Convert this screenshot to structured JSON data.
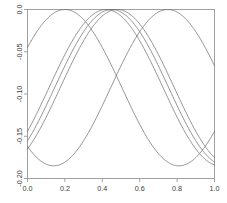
{
  "chart_data": {
    "type": "line",
    "title": "",
    "subtitle": "",
    "xlabel": "",
    "ylabel": "",
    "xlim": [
      0.0,
      1.0
    ],
    "ylim": [
      -0.2,
      0.0
    ],
    "grid": false,
    "legend": null,
    "x_ticks": [
      {
        "value": 0.0,
        "label": "0.0"
      },
      {
        "value": 0.2,
        "label": "0.2"
      },
      {
        "value": 0.4,
        "label": "0.4"
      },
      {
        "value": 0.6,
        "label": "0.6"
      },
      {
        "value": 0.8,
        "label": "0.8"
      },
      {
        "value": 1.0,
        "label": "1.0"
      }
    ],
    "y_ticks": [
      {
        "value": 0.0,
        "label": "0.0"
      },
      {
        "value": -0.05,
        "label": "-0.05"
      },
      {
        "value": -0.1,
        "label": "-0.10"
      },
      {
        "value": -0.15,
        "label": "-0.15"
      },
      {
        "value": -0.2,
        "label": "-0.20"
      }
    ],
    "line_color": "#6e6e6e",
    "frame_color": "#8a8a8a",
    "series": [
      {
        "name": "curve-1",
        "form": "cosine",
        "amplitude": 0.0925,
        "offset": -0.0925,
        "period": 1.22,
        "peak_x": 0.2,
        "peak_y": 0.0,
        "trough_y": -0.185,
        "x": [
          0.0,
          0.05,
          0.1,
          0.15,
          0.2,
          0.25,
          0.3,
          0.35,
          0.4,
          0.45,
          0.5,
          0.55,
          0.6,
          0.65,
          0.7,
          0.75,
          0.8,
          0.85,
          0.9,
          0.95,
          1.0
        ],
        "y": [
          -0.0615,
          -0.0359,
          -0.016,
          -0.004,
          0.0,
          -0.004,
          -0.016,
          -0.0359,
          -0.0615,
          -0.091,
          -0.1217,
          -0.1505,
          -0.173,
          -0.1842,
          -0.1843,
          -0.1734,
          -0.151,
          -0.1223,
          -0.0917,
          -0.062,
          -0.0363
        ]
      },
      {
        "name": "curve-2",
        "form": "cosine",
        "amplitude": 0.0925,
        "offset": -0.0925,
        "period": 1.22,
        "peak_x": 0.42,
        "peak_y": 0.0,
        "trough_y": -0.185,
        "x": [
          0.0,
          0.05,
          0.1,
          0.15,
          0.2,
          0.25,
          0.3,
          0.35,
          0.4,
          0.45,
          0.5,
          0.55,
          0.6,
          0.65,
          0.7,
          0.75,
          0.8,
          0.85,
          0.9,
          0.95,
          1.0
        ],
        "y": [
          -0.1505,
          -0.1217,
          -0.091,
          -0.0615,
          -0.0359,
          -0.016,
          -0.004,
          0.0,
          -0.004,
          -0.016,
          -0.0359,
          -0.0615,
          -0.091,
          -0.1217,
          -0.1505,
          -0.173,
          -0.1842,
          -0.1843,
          -0.1734,
          -0.151,
          -0.1223
        ]
      },
      {
        "name": "curve-3",
        "form": "cosine",
        "amplitude": 0.0925,
        "offset": -0.0925,
        "period": 1.22,
        "peak_x": 0.45,
        "peak_y": 0.0,
        "trough_y": -0.185,
        "x": [
          0.0,
          0.05,
          0.1,
          0.15,
          0.2,
          0.25,
          0.3,
          0.35,
          0.4,
          0.45,
          0.5,
          0.55,
          0.6,
          0.65,
          0.7,
          0.75,
          0.8,
          0.85,
          0.9,
          0.95,
          1.0
        ],
        "y": [
          -0.163,
          -0.136,
          -0.105,
          -0.074,
          -0.046,
          -0.023,
          -0.007,
          0.0,
          -0.001,
          -0.009,
          -0.025,
          -0.048,
          -0.076,
          -0.107,
          -0.138,
          -0.164,
          -0.18,
          -0.1845,
          -0.178,
          -0.161,
          -0.135
        ]
      },
      {
        "name": "curve-4",
        "form": "cosine",
        "amplitude": 0.0925,
        "offset": -0.0925,
        "period": 1.22,
        "peak_x": 0.48,
        "peak_y": 0.0,
        "trough_y": -0.185,
        "x": [
          0.0,
          0.05,
          0.1,
          0.15,
          0.2,
          0.25,
          0.3,
          0.35,
          0.4,
          0.45,
          0.5,
          0.55,
          0.6,
          0.65,
          0.7,
          0.75,
          0.8,
          0.85,
          0.9,
          0.95,
          1.0
        ],
        "y": [
          -0.173,
          -0.1505,
          -0.1217,
          -0.091,
          -0.0615,
          -0.0359,
          -0.016,
          -0.004,
          0.0,
          -0.004,
          -0.016,
          -0.0359,
          -0.0615,
          -0.091,
          -0.1217,
          -0.1505,
          -0.173,
          -0.1842,
          -0.1843,
          -0.1734,
          -0.151
        ]
      },
      {
        "name": "curve-5",
        "form": "cosine",
        "amplitude": 0.0925,
        "offset": -0.0925,
        "period": 1.22,
        "peak_x": 0.75,
        "peak_y": 0.0,
        "trough_y": -0.185,
        "x": [
          0.0,
          0.05,
          0.1,
          0.15,
          0.2,
          0.25,
          0.3,
          0.35,
          0.4,
          0.45,
          0.5,
          0.55,
          0.6,
          0.65,
          0.7,
          0.75,
          0.8,
          0.85,
          0.9,
          0.95,
          1.0
        ],
        "y": [
          -0.173,
          -0.1843,
          -0.1842,
          -0.1734,
          -0.151,
          -0.1223,
          -0.0917,
          -0.062,
          -0.0363,
          -0.0162,
          -0.0041,
          0.0,
          -0.004,
          -0.016,
          -0.0359,
          -0.0615,
          -0.091,
          -0.1217,
          -0.1505,
          -0.173,
          -0.1842
        ]
      }
    ]
  }
}
